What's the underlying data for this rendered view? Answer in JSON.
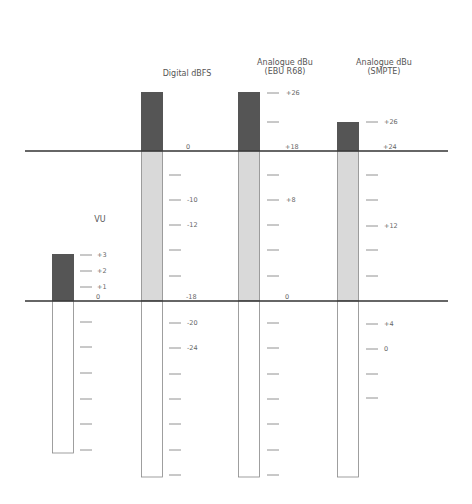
{
  "chart_data": {
    "type": "diagram",
    "title": "",
    "reference_lines": [
      {
        "name": "upper-reference-line",
        "aligns": {
          "VU": "(above scale)",
          "Digital dBFS": "0",
          "Analogue dBu (EBU R68)": "+18",
          "Analogue dBu (SMPTE)": "+24"
        }
      },
      {
        "name": "lower-reference-line",
        "aligns": {
          "VU": "0",
          "Digital dBFS": "-18",
          "Analogue dBu (EBU R68)": "0",
          "Analogue dBu (SMPTE)": "+4"
        }
      }
    ],
    "meters": [
      {
        "id": "vu",
        "title": [
          "VU"
        ],
        "segments": {
          "headroom_top": "+3",
          "line_0": "0"
        },
        "ticks": [
          {
            "label": "+3"
          },
          {
            "label": "+2"
          },
          {
            "label": "+1"
          },
          {
            "label": "0",
            "no_tick": true
          },
          {
            "label": ""
          },
          {
            "label": ""
          },
          {
            "label": ""
          },
          {
            "label": ""
          },
          {
            "label": ""
          },
          {
            "label": ""
          }
        ]
      },
      {
        "id": "dbfs",
        "title": [
          "Digital dBFS"
        ],
        "ticks": [
          {
            "label": "0",
            "no_tick": true
          },
          {
            "label": ""
          },
          {
            "label": "-10"
          },
          {
            "label": "-12"
          },
          {
            "label": ""
          },
          {
            "label": ""
          },
          {
            "label": "-18",
            "no_tick": true
          },
          {
            "label": "-20"
          },
          {
            "label": "-24"
          },
          {
            "label": ""
          },
          {
            "label": ""
          },
          {
            "label": ""
          },
          {
            "label": ""
          },
          {
            "label": ""
          }
        ]
      },
      {
        "id": "ebu",
        "title": [
          "Analogue dBu",
          "(EBU R68)"
        ],
        "ticks": [
          {
            "label": "+26"
          },
          {
            "label": ""
          },
          {
            "label": "+18",
            "no_tick": true
          },
          {
            "label": ""
          },
          {
            "label": "+8"
          },
          {
            "label": ""
          },
          {
            "label": ""
          },
          {
            "label": ""
          },
          {
            "label": "0",
            "no_tick": true
          },
          {
            "label": ""
          },
          {
            "label": ""
          },
          {
            "label": ""
          },
          {
            "label": ""
          },
          {
            "label": ""
          },
          {
            "label": ""
          },
          {
            "label": ""
          }
        ]
      },
      {
        "id": "smpte",
        "title": [
          "Analogue dBu",
          "(SMPTE)"
        ],
        "ticks": [
          {
            "label": "+26"
          },
          {
            "label": "+24",
            "no_tick": true
          },
          {
            "label": ""
          },
          {
            "label": ""
          },
          {
            "label": "+12"
          },
          {
            "label": ""
          },
          {
            "label": ""
          },
          {
            "label": "+4"
          },
          {
            "label": "0"
          },
          {
            "label": ""
          },
          {
            "label": ""
          }
        ]
      }
    ],
    "colors": {
      "headroom": "#555555",
      "operating_range": "#d9d9d9",
      "below_reference": "#ffffff",
      "outline": "#888888",
      "reference_line": "#333333",
      "tick": "#777777"
    }
  }
}
